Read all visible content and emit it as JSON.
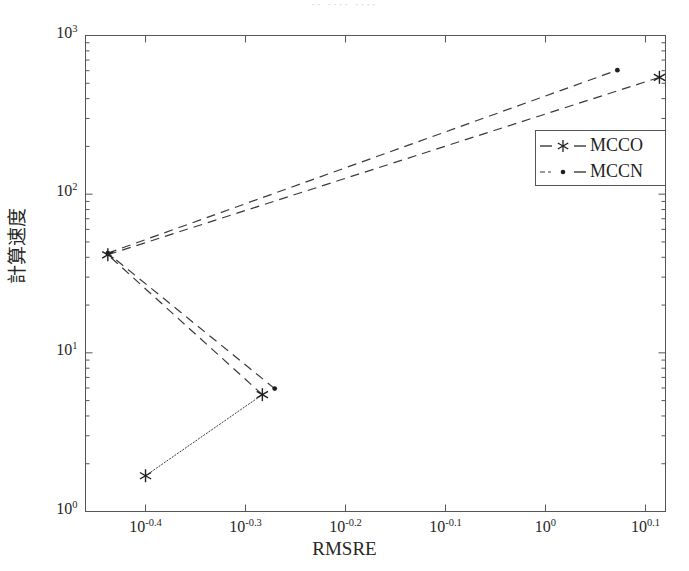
{
  "figure": {
    "top_remnant_text": "··   ····            ····",
    "background_color": "#ffffff",
    "frame_color": "#555555",
    "line_color": "#3a3a3a"
  },
  "chart_data": {
    "type": "line",
    "title": "",
    "xlabel": "RMSRE",
    "ylabel": "計算速度",
    "xscale": "log",
    "yscale": "log",
    "xlim": [
      0.3467,
      1.3183
    ],
    "ylim": [
      1,
      1000
    ],
    "grid": false,
    "legend_position": "center-right",
    "xticks": [
      {
        "value": 0.398107,
        "label": "10",
        "exp": "-0.4"
      },
      {
        "value": 0.501187,
        "label": "10",
        "exp": "-0.3"
      },
      {
        "value": 0.630957,
        "label": "10",
        "exp": "-0.2"
      },
      {
        "value": 0.794328,
        "label": "10",
        "exp": "-0.1"
      },
      {
        "value": 1.0,
        "label": "10",
        "exp": "0"
      },
      {
        "value": 1.258925,
        "label": "10",
        "exp": "0.1"
      }
    ],
    "yticks": [
      {
        "value": 1,
        "label": "10",
        "exp": "0"
      },
      {
        "value": 10,
        "label": "10",
        "exp": "1"
      },
      {
        "value": 100,
        "label": "10",
        "exp": "2"
      },
      {
        "value": 1000,
        "label": "10",
        "exp": "3"
      }
    ],
    "series": [
      {
        "name": "MCCO",
        "marker": "asterisk",
        "linestyle": "dashed",
        "points": [
          {
            "x": 0.398107,
            "y": 1.68
          },
          {
            "x": 0.521,
            "y": 5.45
          },
          {
            "x": 0.365,
            "y": 41.5
          },
          {
            "x": 1.3,
            "y": 545.0
          }
        ]
      },
      {
        "name": "MCCN",
        "marker": "dot",
        "linestyle": "dashed",
        "points": [
          {
            "x": 0.536,
            "y": 5.95
          },
          {
            "x": 0.365,
            "y": 42.5
          },
          {
            "x": 1.18,
            "y": 605.0
          }
        ]
      }
    ]
  },
  "legend": {
    "entries": [
      {
        "label": "MCCO",
        "marker": "asterisk"
      },
      {
        "label": "MCCN",
        "marker": "dot"
      }
    ]
  }
}
